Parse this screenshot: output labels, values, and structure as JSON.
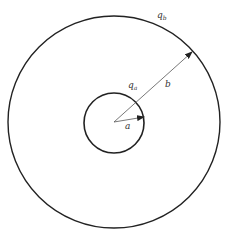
{
  "diagram": {
    "colors": {
      "stroke": "#222222",
      "thin_line": "#555555",
      "background": "#ffffff",
      "text": "#333333"
    },
    "outer_shell": {
      "label": "q",
      "label_sub": "b",
      "center": [
        114,
        122
      ],
      "radius": 106
    },
    "inner_shell": {
      "label": "q",
      "label_sub": "a",
      "center": [
        114,
        123
      ],
      "radius": 30
    },
    "radius_b": {
      "label": "b",
      "from": [
        114,
        122
      ],
      "to": [
        192,
        52
      ]
    },
    "radius_a": {
      "label": "a",
      "from": [
        114,
        122
      ],
      "to": [
        144,
        117
      ]
    }
  }
}
